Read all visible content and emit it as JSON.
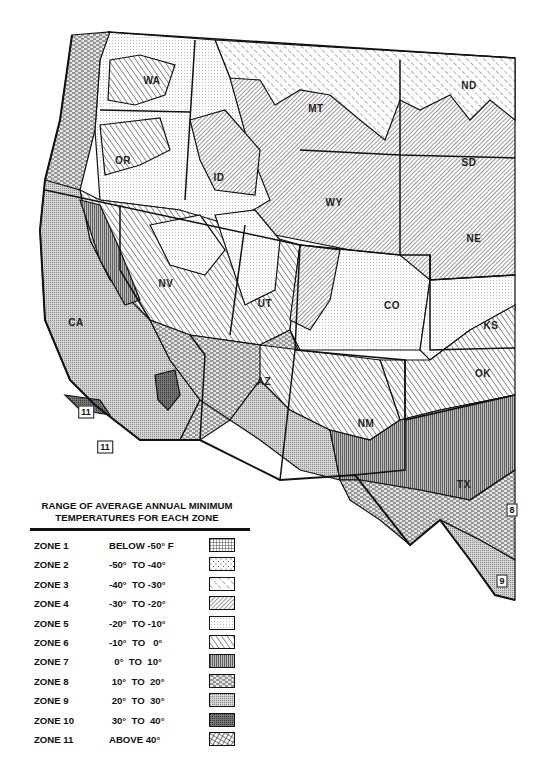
{
  "map": {
    "title": "USDA Plant Hardiness Zone Map — Western United States",
    "states": [
      {
        "abbr": "WA",
        "x": 152,
        "y": 80
      },
      {
        "abbr": "OR",
        "x": 123,
        "y": 160
      },
      {
        "abbr": "ID",
        "x": 219,
        "y": 177
      },
      {
        "abbr": "MT",
        "x": 316,
        "y": 108
      },
      {
        "abbr": "ND",
        "x": 469,
        "y": 85
      },
      {
        "abbr": "SD",
        "x": 469,
        "y": 162
      },
      {
        "abbr": "WY",
        "x": 334,
        "y": 202
      },
      {
        "abbr": "NE",
        "x": 474,
        "y": 238
      },
      {
        "abbr": "NV",
        "x": 166,
        "y": 283
      },
      {
        "abbr": "UT",
        "x": 265,
        "y": 303
      },
      {
        "abbr": "CO",
        "x": 392,
        "y": 305
      },
      {
        "abbr": "KS",
        "x": 491,
        "y": 325
      },
      {
        "abbr": "CA",
        "x": 76,
        "y": 322
      },
      {
        "abbr": "AZ",
        "x": 264,
        "y": 381
      },
      {
        "abbr": "NM",
        "x": 366,
        "y": 423
      },
      {
        "abbr": "OK",
        "x": 483,
        "y": 373
      },
      {
        "abbr": "TX",
        "x": 464,
        "y": 484
      }
    ],
    "zone_markers": [
      {
        "label": "11",
        "x": 86,
        "y": 412
      },
      {
        "label": "11",
        "x": 105,
        "y": 447
      },
      {
        "label": "8",
        "x": 512,
        "y": 510
      },
      {
        "label": "9",
        "x": 502,
        "y": 581
      }
    ]
  },
  "legend": {
    "title_line1": "RANGE OF AVERAGE ANNUAL MINIMUM",
    "title_line2": "TEMPERATURES FOR EACH ZONE",
    "zones": [
      {
        "zone": "ZONE 1",
        "range": "BELOW -50° F",
        "pattern": "grid"
      },
      {
        "zone": "ZONE 2",
        "range": "-50°  TO -40°",
        "pattern": "sparse-dots"
      },
      {
        "zone": "ZONE 3",
        "range": "-40°  TO -30°",
        "pattern": "sparse-back-diagonal"
      },
      {
        "zone": "ZONE 4",
        "range": "-30°  TO -20°",
        "pattern": "dense-forward-diagonal"
      },
      {
        "zone": "ZONE 5",
        "range": "-20°  TO -10°",
        "pattern": "fine-dots"
      },
      {
        "zone": "ZONE 6",
        "range": "-10°  TO   0°",
        "pattern": "back-diagonal"
      },
      {
        "zone": "ZONE 7",
        "range": "  0°  TO  10°",
        "pattern": "vertical-lines"
      },
      {
        "zone": "ZONE 8",
        "range": " 10°  TO  20°",
        "pattern": "dashes"
      },
      {
        "zone": "ZONE 9",
        "range": " 20°  TO  30°",
        "pattern": "stipple"
      },
      {
        "zone": "ZONE 10",
        "range": " 30°  TO  40°",
        "pattern": "dense-crosshatch"
      },
      {
        "zone": "ZONE 11",
        "range": "ABOVE 40°",
        "pattern": "diamond-crosshatch"
      }
    ]
  }
}
